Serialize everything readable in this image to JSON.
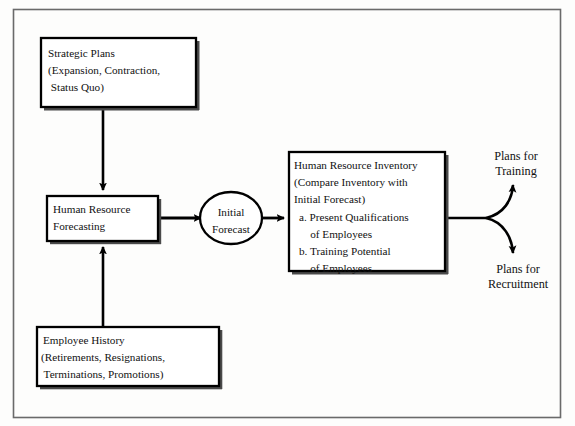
{
  "diagram": {
    "outer_frame": {
      "stroke": "#555555"
    },
    "nodes": [
      {
        "id": "strategic-plans",
        "shape": "rectangle",
        "lines": [
          "Strategic Plans",
          "(Expansion, Contraction,",
          " Status Quo)"
        ]
      },
      {
        "id": "human-resource-forecasting",
        "shape": "rectangle",
        "lines": [
          "Human Resource",
          "Forecasting"
        ]
      },
      {
        "id": "employee-history",
        "shape": "rectangle",
        "lines": [
          "Employee History",
          "(Retirements, Resignations,",
          " Terminations, Promotions)"
        ]
      },
      {
        "id": "initial-forecast",
        "shape": "ellipse",
        "lines": [
          "Initial",
          "Forecast"
        ]
      },
      {
        "id": "human-resource-inventory",
        "shape": "rectangle",
        "lines": [
          "Human Resource Inventory",
          "(Compare Inventory with",
          "Initial Forecast)",
          "a. Present Qualifications",
          "    of Employees",
          "b. Training Potential",
          "    of Employees"
        ]
      }
    ],
    "outputs": [
      {
        "id": "plans-for-training",
        "lines": [
          "Plans for",
          "Training"
        ]
      },
      {
        "id": "plans-for-recruitment",
        "lines": [
          "Plans for",
          "Recruitment"
        ]
      }
    ],
    "connectors": [
      {
        "id": "strategic-to-forecasting",
        "from": "strategic-plans",
        "to": "human-resource-forecasting",
        "style": "arrow-down"
      },
      {
        "id": "history-to-forecasting",
        "from": "employee-history",
        "to": "human-resource-forecasting",
        "style": "arrow-up"
      },
      {
        "id": "forecasting-to-initial",
        "from": "human-resource-forecasting",
        "to": "initial-forecast",
        "style": "arrow-right"
      },
      {
        "id": "initial-to-inventory",
        "from": "initial-forecast",
        "to": "human-resource-inventory",
        "style": "arrow-right"
      },
      {
        "id": "inventory-to-training",
        "from": "human-resource-inventory",
        "to": "plans-for-training",
        "style": "curve-up-arrow"
      },
      {
        "id": "inventory-to-recruitment",
        "from": "human-resource-inventory",
        "to": "plans-for-recruitment",
        "style": "curve-down-arrow"
      }
    ],
    "colors": {
      "line": "#000000",
      "text": "#111111",
      "background": "#fdfdfc",
      "shadow": "#4a4a4a"
    }
  }
}
